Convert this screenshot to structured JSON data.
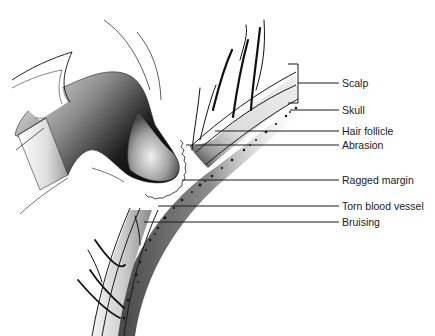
{
  "diagram": {
    "labels": [
      {
        "id": "scalp",
        "text": "Scalp",
        "x": 342,
        "y": 77
      },
      {
        "id": "skull",
        "text": "Skull",
        "x": 342,
        "y": 104
      },
      {
        "id": "hair-follicle",
        "text": "Hair follicle",
        "x": 342,
        "y": 125
      },
      {
        "id": "abrasion",
        "text": "Abrasion",
        "x": 342,
        "y": 139
      },
      {
        "id": "ragged-margin",
        "text": "Ragged margin",
        "x": 342,
        "y": 176
      },
      {
        "id": "torn-blood-vessel",
        "text": "Torn blood vessel",
        "x": 342,
        "y": 202
      },
      {
        "id": "bruising",
        "text": "Bruising",
        "x": 342,
        "y": 217
      }
    ],
    "colors": {
      "line": "#1a1a1a",
      "dark": "#111111",
      "mid": "#888888",
      "light": "#e6e6e6",
      "background": "#ffffff"
    }
  }
}
